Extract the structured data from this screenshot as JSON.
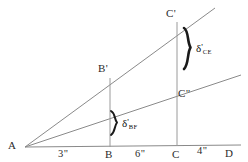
{
  "figure": {
    "type": "geometry-diagram",
    "background_color": "#ffffff",
    "line_color": "#8a8a8a",
    "brace_color": "#1a1a1a",
    "text_color": "#2b2b2b"
  },
  "points": {
    "a": "A",
    "b": "B",
    "c": "C",
    "d": "D",
    "b_prime": "B'",
    "c_prime": "C'",
    "c_double_prime": "C\""
  },
  "dimensions": {
    "ab": "3\"",
    "bc": "6\"",
    "cd": "4\""
  },
  "deflections": {
    "ce": {
      "symbol": "δ",
      "prime": "'",
      "subscript": "CE"
    },
    "bf": {
      "symbol": "δ",
      "prime": "'",
      "subscript": "BF"
    }
  },
  "geometry": {
    "baseline": {
      "x1": 25,
      "y1": 147,
      "x2": 241,
      "y2": 145
    },
    "upper_ray": {
      "x1": 25,
      "y1": 147,
      "x2": 215,
      "y2": 8
    },
    "lower_ray": {
      "x1": 25,
      "y1": 147,
      "x2": 241,
      "y2": 75
    },
    "vertical_b": {
      "x": 110,
      "y1": 78,
      "y2": 147
    },
    "vertical_c": {
      "x": 177,
      "y1": 22,
      "y2": 146
    },
    "brace_large": {
      "x": 186,
      "y_top": 28,
      "y_bottom": 69
    },
    "brace_small": {
      "x": 113,
      "y_top": 111,
      "y_bottom": 135
    }
  }
}
